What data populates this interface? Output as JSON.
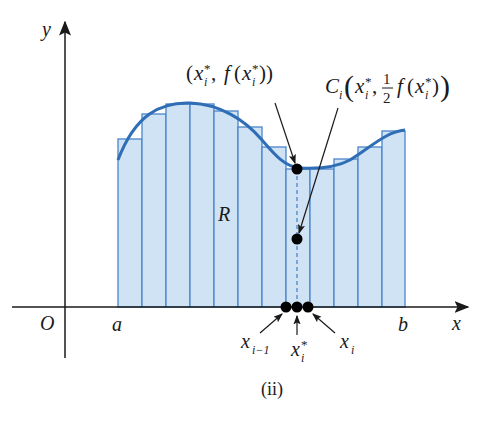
{
  "figure": {
    "caption": "(ii)",
    "axes": {
      "x_label": "x",
      "y_label": "y",
      "origin_label": "O"
    },
    "interval": {
      "left_label": "a",
      "right_label": "b"
    },
    "region_label": "R",
    "annotations": {
      "top_point": {
        "open": "(",
        "x": "x",
        "x_sub": "i",
        "x_sup": "*",
        "comma": ", ",
        "f": "f",
        "fopen": "(",
        "fx": "x",
        "fx_sub": "i",
        "fx_sup": "*",
        "close": "))"
      },
      "centroid_point": {
        "name": "C",
        "name_sub": "i",
        "x": "x",
        "x_sub": "i",
        "x_sup": "*",
        "frac_num": "1",
        "frac_den": "2",
        "f": "f",
        "fx": "x",
        "fx_sub": "i",
        "fx_sup": "*"
      },
      "axis_points": {
        "left": {
          "base": "x",
          "sub": "i−1"
        },
        "mid": {
          "base": "x",
          "sub": "i",
          "sup": "*"
        },
        "right": {
          "base": "x",
          "sub": "i"
        }
      }
    },
    "colors": {
      "fill": "#cfe3f5",
      "stroke": "#4a86c8",
      "curve": "#2f6db5",
      "axis": "#1a1a1a",
      "point": "#000000"
    },
    "strips": {
      "edges_x": [
        118,
        142,
        166,
        190,
        214,
        238,
        262,
        286,
        310,
        334,
        358,
        382,
        405
      ],
      "tops_y": [
        139,
        114,
        104,
        104,
        111,
        127,
        147,
        169,
        169,
        159,
        147,
        131
      ],
      "baseline_y": 307
    }
  }
}
